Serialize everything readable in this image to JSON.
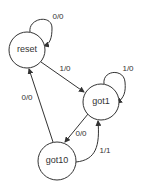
{
  "diagram": {
    "type": "finite-state-machine",
    "states": [
      {
        "id": "reset",
        "label": "reset"
      },
      {
        "id": "got1",
        "label": "got1"
      },
      {
        "id": "got10",
        "label": "got10"
      }
    ],
    "transitions": [
      {
        "from": "reset",
        "to": "reset",
        "label": "0/0"
      },
      {
        "from": "reset",
        "to": "got1",
        "label": "1/0"
      },
      {
        "from": "got1",
        "to": "got1",
        "label": "1/0"
      },
      {
        "from": "got1",
        "to": "got10",
        "label": "0/0"
      },
      {
        "from": "got10",
        "to": "got1",
        "label": "1/1"
      },
      {
        "from": "got10",
        "to": "reset",
        "label": "0/0"
      }
    ]
  },
  "colors": {
    "stroke": "#333333",
    "background": "#ffffff"
  }
}
